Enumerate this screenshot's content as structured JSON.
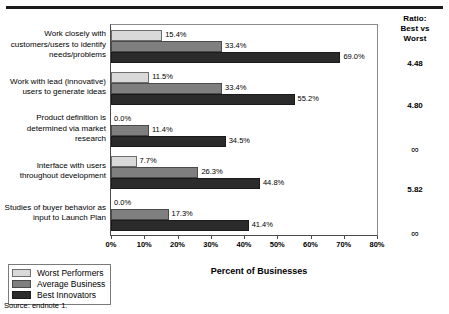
{
  "chart_data": {
    "type": "bar",
    "orientation": "horizontal",
    "title": "",
    "xlabel": "Percent of Businesses",
    "ylabel": "",
    "xlim": [
      0,
      80
    ],
    "xticks": [
      0,
      10,
      20,
      30,
      40,
      50,
      60,
      70,
      80
    ],
    "xticklabels": [
      "0%",
      "10%",
      "20%",
      "30%",
      "40%",
      "50%",
      "60%",
      "70%",
      "80%"
    ],
    "grid": false,
    "legend_position": "bottom-left",
    "categories": [
      "Work closely with customers/users to identify needs/problems",
      "Work with lead (innovative) users to generate ideas",
      "Product definition is determined via market research",
      "Interface with users throughout development",
      "Studies of buyer behavior as input to Launch Plan"
    ],
    "series": [
      {
        "name": "Worst Performers",
        "color": "#d9d9d9",
        "values": [
          15.4,
          11.5,
          0.0,
          7.7,
          0.0
        ],
        "labels": [
          "15.4%",
          "11.5%",
          "0.0%",
          "7.7%",
          "0.0%"
        ]
      },
      {
        "name": "Average Business",
        "color": "#7f7f7f",
        "values": [
          33.4,
          33.4,
          11.4,
          26.3,
          17.3
        ],
        "labels": [
          "33.4%",
          "33.4%",
          "11.4%",
          "26.3%",
          "17.3%"
        ]
      },
      {
        "name": "Best Innovators",
        "color": "#2b2b2b",
        "values": [
          69.0,
          55.2,
          34.5,
          44.8,
          41.4
        ],
        "labels": [
          "69.0%",
          "55.2%",
          "34.5%",
          "44.8%",
          "41.4%"
        ]
      }
    ],
    "annotations": {
      "ratio_header": [
        "Ratio:",
        "Best vs",
        "Worst"
      ],
      "ratio_values": [
        "4.48",
        "4.80",
        "∞",
        "5.82",
        "∞"
      ]
    },
    "source": "Source: endnote 1."
  },
  "legend": {
    "items": [
      {
        "label": "Worst Performers"
      },
      {
        "label": "Average Business"
      },
      {
        "label": "Best Innovators"
      }
    ]
  },
  "xaxis": {
    "title": "Percent of Businesses"
  },
  "ratio": {
    "header_line1": "Ratio:",
    "header_line2": "Best vs",
    "header_line3": "Worst",
    "values": [
      "4.48",
      "4.80",
      "∞",
      "5.82",
      "∞"
    ]
  },
  "footer": {
    "source": "Source: endnote 1."
  }
}
